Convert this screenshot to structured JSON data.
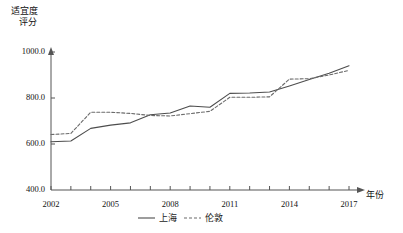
{
  "chart_data": {
    "type": "line",
    "title": "",
    "ylabel": "适宜度\n评分",
    "ylabel_line1": "适宜度",
    "ylabel_line2": "评分",
    "xlabel": "年份",
    "x": [
      2002,
      2003,
      2004,
      2005,
      2006,
      2007,
      2008,
      2009,
      2010,
      2011,
      2012,
      2013,
      2014,
      2015,
      2016,
      2017
    ],
    "xlim": [
      2002,
      2017
    ],
    "ylim": [
      400,
      1000
    ],
    "yticks": [
      400.0,
      600.0,
      800.0,
      1000.0
    ],
    "ytick_labels": [
      "400.0",
      "600.0",
      "800.0",
      "1000.0"
    ],
    "xticks": [
      2002,
      2003,
      2004,
      2005,
      2006,
      2007,
      2008,
      2009,
      2010,
      2011,
      2012,
      2013,
      2014,
      2015,
      2016,
      2017
    ],
    "xtick_labels_shown": [
      "2002",
      "2005",
      "2008",
      "2011",
      "2014",
      "2017"
    ],
    "xtick_labels_shown_values": [
      2002,
      2005,
      2008,
      2011,
      2014,
      2017
    ],
    "grid": false,
    "legend_position": "bottom-center",
    "series": [
      {
        "name": "上海",
        "style": "solid",
        "color": "#4d4d4d",
        "values": [
          610,
          613,
          668,
          682,
          692,
          727,
          735,
          765,
          760,
          820,
          822,
          826,
          852,
          880,
          908,
          940
        ]
      },
      {
        "name": "伦敦",
        "style": "dashed",
        "color": "#6b6b6b",
        "values": [
          641,
          646,
          738,
          738,
          733,
          724,
          722,
          732,
          742,
          803,
          803,
          805,
          882,
          884,
          900,
          920
        ]
      }
    ]
  },
  "legend": {
    "items": [
      {
        "label": "上海",
        "style": "solid"
      },
      {
        "label": "伦敦",
        "style": "dashed"
      }
    ]
  }
}
